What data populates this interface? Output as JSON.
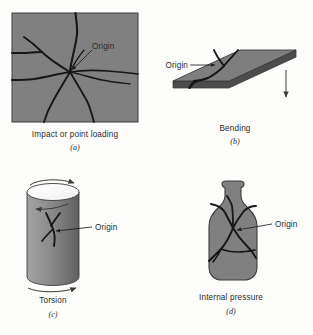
{
  "figure": {
    "background_color": "#fdfdfc",
    "body_gray": "#808080",
    "edge_dark": "#4a4a4a",
    "crack_color": "#17171a",
    "text_color": "#2b2b2b"
  },
  "panels": [
    {
      "id": "a",
      "letter": "(a)",
      "caption": "Impact or point loading",
      "origin_label": "Origin",
      "shape": "rectangular-plate",
      "crack_pattern": "radial-star-from-point",
      "crack_count": 8
    },
    {
      "id": "b",
      "letter": "(b)",
      "caption": "Bending",
      "origin_label": "Origin",
      "shape": "isometric-flat-plate",
      "crack_pattern": "single-transverse-branching-crack",
      "load_arrow": "downward"
    },
    {
      "id": "c",
      "letter": "(c)",
      "caption": "Torsion",
      "origin_label": "Origin",
      "shape": "cylinder",
      "crack_pattern": "helical-branching-crack",
      "load_arrows": [
        "top-curved-right",
        "mid-curved-left",
        "bottom-curved-right"
      ]
    },
    {
      "id": "d",
      "letter": "(d)",
      "caption": "Internal pressure",
      "origin_label": "Origin",
      "shape": "bottle-vessel",
      "crack_pattern": "branching-from-central-origin",
      "crack_count": 6
    }
  ]
}
